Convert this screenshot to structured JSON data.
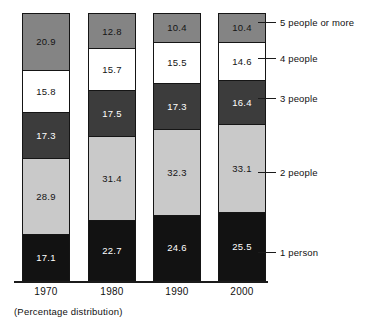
{
  "chart_data": {
    "type": "bar",
    "subtype": "stacked-100-percent",
    "title": "",
    "subtitle": "",
    "caption": "(Percentage distribution)",
    "xlabel": "",
    "ylabel": "",
    "ylim": [
      0,
      100
    ],
    "grid": false,
    "legend_position": "right-callout",
    "categories": [
      "1970",
      "1980",
      "1990",
      "2000"
    ],
    "series": [
      {
        "name": "1 person",
        "color": "#121212",
        "text_color": "#ffffff",
        "values": [
          17.1,
          22.7,
          24.6,
          25.5
        ]
      },
      {
        "name": "2 people",
        "color": "#c9c9c9",
        "text_color": "#141414",
        "values": [
          28.9,
          31.4,
          32.3,
          33.1
        ]
      },
      {
        "name": "3 people",
        "color": "#3c3c3c",
        "text_color": "#ffffff",
        "values": [
          17.3,
          17.5,
          17.3,
          16.4
        ]
      },
      {
        "name": "4 people",
        "color": "#ffffff",
        "text_color": "#141414",
        "values": [
          15.8,
          15.7,
          15.5,
          14.6
        ]
      },
      {
        "name": "5 people or more",
        "color": "#848484",
        "text_color": "#141414",
        "values": [
          20.9,
          12.8,
          10.4,
          10.4
        ]
      }
    ],
    "bars": [
      {
        "category": "1970",
        "segments": [
          {
            "label": "5 people or more",
            "value": "20.9"
          },
          {
            "label": "4 people",
            "value": "15.8"
          },
          {
            "label": "3 people",
            "value": "17.3"
          },
          {
            "label": "2 people",
            "value": "28.9"
          },
          {
            "label": "1 person",
            "value": "17.1"
          }
        ]
      },
      {
        "category": "1980",
        "segments": [
          {
            "label": "5 people or more",
            "value": "12.8"
          },
          {
            "label": "4 people",
            "value": "15.7"
          },
          {
            "label": "3 people",
            "value": "17.5"
          },
          {
            "label": "2 people",
            "value": "31.4"
          },
          {
            "label": "1 person",
            "value": "22.7"
          }
        ]
      },
      {
        "category": "1990",
        "segments": [
          {
            "label": "5 people or more",
            "value": "10.4"
          },
          {
            "label": "4 people",
            "value": "15.5"
          },
          {
            "label": "3 people",
            "value": "17.3"
          },
          {
            "label": "2 people",
            "value": "32.3"
          },
          {
            "label": "1 person",
            "value": "24.6"
          }
        ]
      },
      {
        "category": "2000",
        "segments": [
          {
            "label": "5 people or more",
            "value": "10.4"
          },
          {
            "label": "4 people",
            "value": "14.6"
          },
          {
            "label": "3 people",
            "value": "16.4"
          },
          {
            "label": "2 people",
            "value": "33.1"
          },
          {
            "label": "1 person",
            "value": "25.5"
          }
        ]
      }
    ],
    "legend": [
      "5 people or more",
      "4 people",
      "3 people",
      "2 people",
      "1 person"
    ]
  }
}
